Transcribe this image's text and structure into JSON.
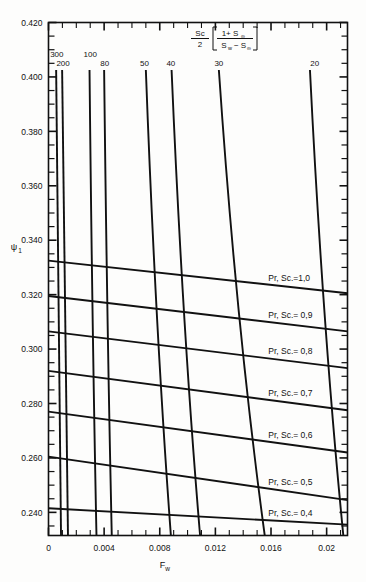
{
  "chart_data": {
    "type": "line",
    "title": "",
    "xlabel": "F_w",
    "ylabel": "psi_1",
    "xlim": [
      0,
      0.0215
    ],
    "ylim": [
      0.2315,
      0.42
    ],
    "grid": false,
    "xticks": [
      0,
      0.004,
      0.008,
      0.012,
      0.016,
      0.02
    ],
    "xticklabels": [
      "0",
      "0.004",
      "0.008",
      "0.012",
      "0.016",
      "0.02"
    ],
    "yticks": [
      0.24,
      0.26,
      0.28,
      0.3,
      0.32,
      0.34,
      0.36,
      0.38,
      0.4,
      0.42
    ],
    "yticklabels": [
      "0.240",
      "0.260",
      "0.280",
      "0.300",
      "0.320",
      "0.340",
      "0.360",
      "0.380",
      "0.400",
      "0.420"
    ],
    "minor_ytick_step": 0.005,
    "minor_xtick_step": 0.001,
    "legend_position": "top-center",
    "legend_formula": {
      "numerator": "Sc",
      "denominator": "2",
      "bracket_numerator": "1+ S",
      "bracket_numerator_sub": "∞",
      "bracket_denominator_a": "S",
      "bracket_denominator_a_sub": "w",
      "bracket_denominator_b": "− S",
      "bracket_denominator_b_sub": "∞"
    },
    "family_a_name": "Sc/2[(1+S∞)/(Sw-S∞)] parameter curves",
    "family_a": [
      {
        "label": "300",
        "x_top": 0.00055,
        "x_bottom": 0.0009,
        "label_x": 0.0006,
        "label_row": 0
      },
      {
        "label": "200",
        "x_top": 0.00098,
        "x_bottom": 0.0014,
        "label_x": 0.00105,
        "label_row": 1
      },
      {
        "label": "100",
        "x_top": 0.00295,
        "x_bottom": 0.00345,
        "label_x": 0.003,
        "label_row": 0
      },
      {
        "label": "80",
        "x_top": 0.004,
        "x_bottom": 0.00455,
        "label_x": 0.00405,
        "label_row": 1
      },
      {
        "label": "50",
        "x_top": 0.007,
        "x_bottom": 0.0088,
        "label_x": 0.0069,
        "label_row": 1
      },
      {
        "label": "40",
        "x_top": 0.00885,
        "x_bottom": 0.0109,
        "label_x": 0.0088,
        "label_row": 1
      },
      {
        "label": "30",
        "x_top": 0.01225,
        "x_bottom": 0.01555,
        "label_x": 0.01225,
        "label_row": 1
      },
      {
        "label": "20",
        "x_top": 0.0188,
        "x_bottom": 0.0212,
        "label_x": 0.01915,
        "label_row": 1
      }
    ],
    "family_b_name": "Pr, Sc. lines",
    "family_b": [
      {
        "label": "Pr, Sc.=1,0",
        "y_left": 0.3325,
        "y_right": 0.3205
      },
      {
        "label": "Pr, Sc.= 0,9",
        "y_left": 0.3195,
        "y_right": 0.3065
      },
      {
        "label": "Pr, Sc.= 0,8",
        "y_left": 0.3065,
        "y_right": 0.293
      },
      {
        "label": "Pr, Sc.= 0,7",
        "y_left": 0.292,
        "y_right": 0.2775
      },
      {
        "label": "Pr, Sc.= 0,6",
        "y_left": 0.277,
        "y_right": 0.262
      },
      {
        "label": "Pr, Sc.= 0,5",
        "y_left": 0.2605,
        "y_right": 0.2445
      },
      {
        "label": "Pr, Sc.= 0,4",
        "y_left": 0.2415,
        "y_right": 0.2355
      }
    ]
  }
}
